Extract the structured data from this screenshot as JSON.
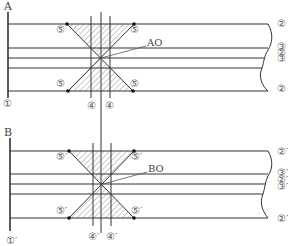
{
  "panels": [
    {
      "id": "A",
      "label": "A",
      "base_label": "①",
      "annotation": "AO",
      "corner_labels": {
        "top_left": "⑤",
        "top_right": "⑤",
        "bottom_left": "⑤",
        "bottom_right": "⑤"
      },
      "vertical_labels": [
        "④",
        "④"
      ],
      "right_labels": [
        "②",
        "③",
        "②",
        "③",
        "②"
      ]
    },
    {
      "id": "B",
      "label": "B",
      "base_label": "①′",
      "annotation": "BO",
      "corner_labels": {
        "top_left": "⑤′",
        "top_right": "⑤′",
        "bottom_left": "⑤′",
        "bottom_right": "⑤′"
      },
      "vertical_labels": [
        "④′",
        "④′"
      ],
      "right_labels": [
        "②′",
        "③′",
        "②′",
        "③′",
        "②′"
      ]
    }
  ],
  "colors": {
    "line": "#333333",
    "hatch": "#777777",
    "text": "#555555"
  }
}
